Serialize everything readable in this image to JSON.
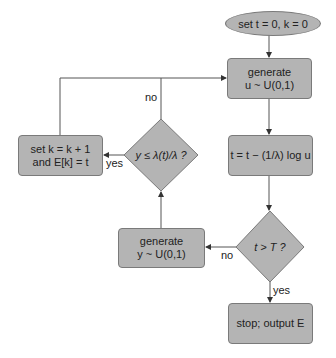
{
  "diagram": {
    "type": "flowchart",
    "colors": {
      "node_fill": "#b4b4b4",
      "node_border": "#7a7a7a",
      "line": "#555555"
    },
    "nodes": {
      "start": {
        "shape": "ellipse",
        "label": "set t = 0, k = 0"
      },
      "gen_u": {
        "shape": "rounded-rect",
        "line1": "generate",
        "line2": "u ~ U(0,1)"
      },
      "update_t": {
        "shape": "rounded-rect",
        "label": "t = t − (1/λ) log u"
      },
      "check_T": {
        "shape": "diamond",
        "label": "t > T ?"
      },
      "gen_y": {
        "shape": "rounded-rect",
        "line1": "generate",
        "line2": "y ~ U(0,1)"
      },
      "check_y": {
        "shape": "diamond",
        "label": "y ≤ λ(t)/λ ?"
      },
      "set_k": {
        "shape": "rounded-rect",
        "line1": "set k = k + 1",
        "line2": "and E[k] = t"
      },
      "stop": {
        "shape": "rounded-rect",
        "label": "stop; output E"
      }
    },
    "edge_labels": {
      "check_y_no": "no",
      "check_y_yes": "yes",
      "check_T_no": "no",
      "check_T_yes": "yes"
    },
    "edges": [
      [
        "start",
        "gen_u"
      ],
      [
        "gen_u",
        "update_t"
      ],
      [
        "update_t",
        "check_T"
      ],
      [
        "check_T",
        "gen_y",
        "no"
      ],
      [
        "check_T",
        "stop",
        "yes"
      ],
      [
        "gen_y",
        "check_y"
      ],
      [
        "check_y",
        "set_k",
        "yes"
      ],
      [
        "check_y",
        "gen_u",
        "no"
      ],
      [
        "set_k",
        "gen_u"
      ]
    ]
  }
}
